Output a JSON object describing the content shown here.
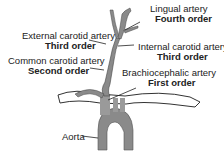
{
  "labels": {
    "lingual": {
      "name": "Lingual artery",
      "order": "Fourth order"
    },
    "external": {
      "name": "External carotid artery",
      "order": "Third order"
    },
    "internal": {
      "name": "Internal carotid artery",
      "order": "Third order"
    },
    "common": {
      "name": "Common carotid artery",
      "order": "Second order"
    },
    "brachio": {
      "name": "Brachiocephalic artery",
      "order": "First order"
    },
    "aorta": {
      "name": "Aorta"
    }
  },
  "colors": {
    "vessel": "#8a8a8a",
    "outline": "#333333",
    "bone": "#ffffff"
  }
}
